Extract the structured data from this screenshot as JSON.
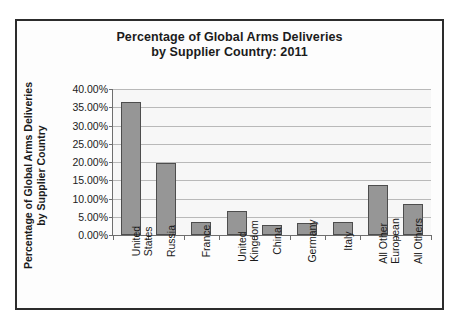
{
  "chart_data": {
    "type": "bar",
    "title": "Percentage of Global Arms Deliveries by Supplier Country: 2011",
    "title_line1": "Percentage of Global Arms Deliveries",
    "title_line2": "by Supplier Country: 2011",
    "xlabel": "",
    "ylabel": "Percentage of Global Arms Deliveries by Supplier Country",
    "ylabel_line1": "Percentage of Global Arms Deliveries",
    "ylabel_line2": "by Supplier Country",
    "ylim": [
      0,
      40
    ],
    "grid": true,
    "legend": false,
    "bar_color": "#969696",
    "bar_border_color": "#4d4d4d",
    "gridline_color": "#b9b9b9",
    "plot_background": "#f7f7f7",
    "yticks": [
      {
        "value": 40,
        "label": "40.00%"
      },
      {
        "value": 35,
        "label": "35.00%"
      },
      {
        "value": 30,
        "label": "30.00%"
      },
      {
        "value": 25,
        "label": "25.00%"
      },
      {
        "value": 20,
        "label": "20.00%"
      },
      {
        "value": 15,
        "label": "15.00%"
      },
      {
        "value": 10,
        "label": "10.00%"
      },
      {
        "value": 5,
        "label": "5.00%"
      },
      {
        "value": 0,
        "label": "0.00%"
      }
    ],
    "categories": [
      "United States",
      "Russia",
      "France",
      "United Kingdom",
      "China",
      "Germany",
      "Italy",
      "All Other European",
      "All Others"
    ],
    "category_lines": [
      [
        "United",
        "States"
      ],
      [
        "Russia",
        ""
      ],
      [
        "France",
        ""
      ],
      [
        "United",
        "Kingdom"
      ],
      [
        "China",
        ""
      ],
      [
        "Germany",
        ""
      ],
      [
        "Italy",
        ""
      ],
      [
        "All Other",
        "European"
      ],
      [
        "All Others",
        ""
      ]
    ],
    "values": [
      36.5,
      19.6,
      3.7,
      6.6,
      2.7,
      3.3,
      3.5,
      13.6,
      8.4
    ]
  }
}
